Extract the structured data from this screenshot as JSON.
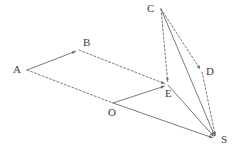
{
  "figure": {
    "kind": "vector-parallelogram-diagram",
    "width": 237,
    "height": 155,
    "background_color": "#ffffff",
    "stroke_color": "#6b6b6b",
    "label_color": "#3a3a3a",
    "dash_pattern": "2,2",
    "stroke_width": 0.9,
    "points": {
      "A": {
        "label": "A",
        "x": 27,
        "y": 70,
        "label_x": 13,
        "label_y": 64
      },
      "B": {
        "label": "B",
        "x": 79,
        "y": 50,
        "label_x": 83,
        "label_y": 37
      },
      "O": {
        "label": "O",
        "x": 113,
        "y": 103,
        "label_x": 108,
        "label_y": 107
      },
      "E": {
        "label": "E",
        "x": 168,
        "y": 85,
        "label_x": 165,
        "label_y": 88
      },
      "C": {
        "label": "C",
        "x": 161,
        "y": 9,
        "label_x": 147,
        "label_y": 3
      },
      "D": {
        "label": "D",
        "x": 202,
        "y": 72,
        "label_x": 206,
        "label_y": 66
      },
      "S": {
        "label": "S",
        "x": 216,
        "y": 139,
        "label_x": 221,
        "label_y": 134
      }
    },
    "edges": [
      {
        "name": "edge-A-B",
        "from": "A",
        "to": "B",
        "style": "solid",
        "arrow": true
      },
      {
        "name": "edge-A-O",
        "from": "A",
        "to": "O",
        "style": "dashed",
        "arrow": false
      },
      {
        "name": "edge-B-E",
        "from": "B",
        "to": "E",
        "style": "dashed",
        "arrow": true
      },
      {
        "name": "edge-O-E",
        "from": "O",
        "to": "E",
        "style": "solid",
        "arrow": true
      },
      {
        "name": "edge-O-S",
        "from": "O",
        "to": "S",
        "style": "solid",
        "arrow": true
      },
      {
        "name": "edge-C-E",
        "from": "C",
        "to": "E",
        "style": "dashed",
        "arrow": true
      },
      {
        "name": "edge-C-D",
        "from": "C",
        "to": "D",
        "style": "dashed",
        "arrow": true
      },
      {
        "name": "edge-C-S",
        "from": "C",
        "to": "S",
        "style": "solid",
        "arrow": true
      },
      {
        "name": "edge-D-S",
        "from": "D",
        "to": "S",
        "style": "dashed",
        "arrow": true
      },
      {
        "name": "edge-E-S",
        "from": "E",
        "to": "S",
        "style": "solid",
        "arrow": true
      }
    ]
  }
}
